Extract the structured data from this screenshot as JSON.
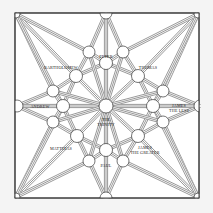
{
  "colors": {
    "background": "#f4f4f4",
    "paper": "#ffffff",
    "ink": "#1a1a1a"
  },
  "labels": {
    "peter": "PETER",
    "bartholomew": "BARTHOLOMEW",
    "thomas": "THOMAS",
    "andrew": "ANDREW",
    "trinity_line1": "THE",
    "trinity_line2": "TRINITY",
    "james_less_line1": "JAMES",
    "james_less_line2": "THE LESS",
    "matthias": "MATTHIAS",
    "james_greater_line1": "JAMES",
    "james_greater_line2": "THE GREATER",
    "paul": "PAUL"
  },
  "nodes": [
    {
      "id": "corner-tl",
      "label": ""
    },
    {
      "id": "top",
      "label": ""
    },
    {
      "id": "corner-tr",
      "label": ""
    },
    {
      "id": "peter-left",
      "label": ""
    },
    {
      "id": "peter",
      "label": "PETER"
    },
    {
      "id": "peter-right",
      "label": ""
    },
    {
      "id": "bartholomew",
      "label": "BARTHOLOMEW"
    },
    {
      "id": "thomas",
      "label": "THOMAS"
    },
    {
      "id": "upper-left",
      "label": ""
    },
    {
      "id": "upper-right",
      "label": ""
    },
    {
      "id": "left-edge",
      "label": ""
    },
    {
      "id": "andrew",
      "label": "ANDREW"
    },
    {
      "id": "trinity",
      "label": "THE TRINITY"
    },
    {
      "id": "james-less",
      "label": "JAMES THE LESS"
    },
    {
      "id": "right-edge",
      "label": ""
    },
    {
      "id": "lower-left",
      "label": ""
    },
    {
      "id": "lower-right",
      "label": ""
    },
    {
      "id": "matthias",
      "label": "MATTHIAS"
    },
    {
      "id": "james-greater",
      "label": "JAMES THE GREATER"
    },
    {
      "id": "paul-left",
      "label": ""
    },
    {
      "id": "paul",
      "label": "PAUL"
    },
    {
      "id": "paul-right",
      "label": ""
    },
    {
      "id": "corner-bl",
      "label": ""
    },
    {
      "id": "bottom",
      "label": ""
    },
    {
      "id": "corner-br",
      "label": ""
    }
  ],
  "edges": [
    [
      "corner-tl",
      "upper-left"
    ],
    [
      "corner-tl",
      "bartholomew"
    ],
    [
      "corner-tl",
      "peter-left"
    ],
    [
      "corner-tl",
      "andrew"
    ],
    [
      "corner-tr",
      "upper-right"
    ],
    [
      "corner-tr",
      "thomas"
    ],
    [
      "corner-tr",
      "peter-right"
    ],
    [
      "corner-tr",
      "james-less"
    ],
    [
      "corner-bl",
      "lower-left"
    ],
    [
      "corner-bl",
      "matthias"
    ],
    [
      "corner-bl",
      "paul-left"
    ],
    [
      "corner-bl",
      "andrew"
    ],
    [
      "corner-br",
      "lower-right"
    ],
    [
      "corner-br",
      "james-greater"
    ],
    [
      "corner-br",
      "paul-right"
    ],
    [
      "corner-br",
      "james-less"
    ],
    [
      "top",
      "peter-left"
    ],
    [
      "top",
      "peter-right"
    ],
    [
      "top",
      "peter"
    ],
    [
      "bottom",
      "paul-left"
    ],
    [
      "bottom",
      "paul-right"
    ],
    [
      "bottom",
      "paul"
    ],
    [
      "left-edge",
      "upper-left"
    ],
    [
      "left-edge",
      "lower-left"
    ],
    [
      "left-edge",
      "andrew"
    ],
    [
      "right-edge",
      "upper-right"
    ],
    [
      "right-edge",
      "lower-right"
    ],
    [
      "right-edge",
      "james-less"
    ],
    [
      "peter",
      "peter-left"
    ],
    [
      "peter",
      "peter-right"
    ],
    [
      "peter",
      "trinity"
    ],
    [
      "paul",
      "paul-left"
    ],
    [
      "paul",
      "paul-right"
    ],
    [
      "paul",
      "trinity"
    ],
    [
      "andrew",
      "upper-left"
    ],
    [
      "andrew",
      "lower-left"
    ],
    [
      "andrew",
      "trinity"
    ],
    [
      "james-less",
      "upper-right"
    ],
    [
      "james-less",
      "lower-right"
    ],
    [
      "james-less",
      "trinity"
    ],
    [
      "bartholomew",
      "peter-left"
    ],
    [
      "bartholomew",
      "upper-left"
    ],
    [
      "bartholomew",
      "trinity"
    ],
    [
      "bartholomew",
      "peter"
    ],
    [
      "bartholomew",
      "andrew"
    ],
    [
      "thomas",
      "peter-right"
    ],
    [
      "thomas",
      "upper-right"
    ],
    [
      "thomas",
      "trinity"
    ],
    [
      "thomas",
      "peter"
    ],
    [
      "thomas",
      "james-less"
    ],
    [
      "matthias",
      "paul-left"
    ],
    [
      "matthias",
      "lower-left"
    ],
    [
      "matthias",
      "trinity"
    ],
    [
      "matthias",
      "paul"
    ],
    [
      "matthias",
      "andrew"
    ],
    [
      "james-greater",
      "paul-right"
    ],
    [
      "james-greater",
      "lower-right"
    ],
    [
      "james-greater",
      "trinity"
    ],
    [
      "james-greater",
      "paul"
    ],
    [
      "james-greater",
      "james-less"
    ],
    [
      "peter-left",
      "trinity"
    ],
    [
      "peter-right",
      "trinity"
    ],
    [
      "paul-left",
      "trinity"
    ],
    [
      "paul-right",
      "trinity"
    ],
    [
      "upper-left",
      "trinity"
    ],
    [
      "upper-right",
      "trinity"
    ],
    [
      "lower-left",
      "trinity"
    ],
    [
      "lower-right",
      "trinity"
    ]
  ]
}
